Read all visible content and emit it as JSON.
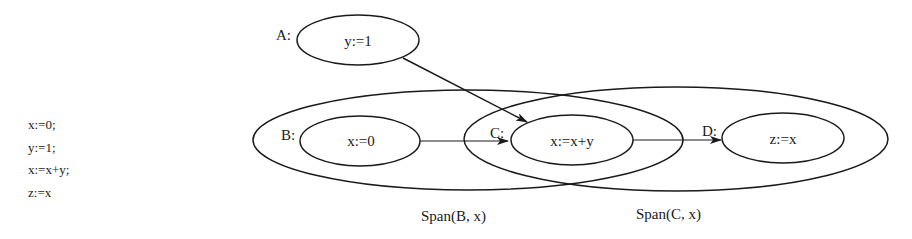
{
  "program": {
    "lines": [
      "x:=0;",
      "y:=1;",
      "x:=x+y;",
      "z:=x"
    ]
  },
  "nodes": {
    "A": {
      "label": "A:",
      "stmt": "y:=1"
    },
    "B": {
      "label": "B:",
      "stmt": "x:=0"
    },
    "C": {
      "label": "C:",
      "stmt": "x:=x+y"
    },
    "D": {
      "label": "D:",
      "stmt": "z:=x"
    }
  },
  "spans": {
    "B": {
      "label": "Span(B, x)"
    },
    "C": {
      "label": "Span(C, x)"
    }
  },
  "edges": [
    {
      "from": "A",
      "to": "C"
    },
    {
      "from": "B",
      "to": "C"
    },
    {
      "from": "C",
      "to": "D"
    }
  ]
}
